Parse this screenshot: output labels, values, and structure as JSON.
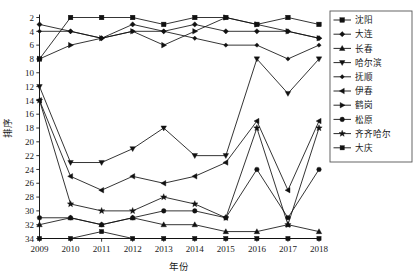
{
  "chart_data": {
    "type": "line",
    "title": "",
    "xlabel": "年份",
    "ylabel": "排序",
    "x": [
      2009,
      2010,
      2011,
      2012,
      2013,
      2014,
      2015,
      2016,
      2017,
      2018
    ],
    "xtick_labels": [
      "2009",
      "2010",
      "2011",
      "2012",
      "2013",
      "2014",
      "2015",
      "2016",
      "2017",
      "2018"
    ],
    "ytick_labels": [
      "2",
      "4",
      "6",
      "8",
      "10",
      "12",
      "14",
      "16",
      "18",
      "20",
      "22",
      "24",
      "26",
      "28",
      "30",
      "32",
      "34"
    ],
    "ytick_values": [
      2,
      4,
      6,
      8,
      10,
      12,
      14,
      16,
      18,
      20,
      22,
      24,
      26,
      28,
      30,
      32,
      34
    ],
    "ylim": [
      2,
      34
    ],
    "y_inverted": true,
    "grid": false,
    "legend_position": "right-outside",
    "series": [
      {
        "name": "沈阳",
        "marker": "square",
        "values": [
          8,
          2,
          2,
          2,
          3,
          2,
          2,
          3,
          2,
          3
        ]
      },
      {
        "name": "大连",
        "marker": "diamond",
        "values": [
          3,
          4,
          5,
          3,
          4,
          3,
          4,
          4,
          4,
          5
        ]
      },
      {
        "name": "长春",
        "marker": "triangle-up",
        "values": [
          32,
          31,
          32,
          31,
          32,
          32,
          33,
          33,
          32,
          33
        ]
      },
      {
        "name": "哈尔滨",
        "marker": "triangle-down",
        "values": [
          12,
          23,
          23,
          21,
          18,
          22,
          22,
          8,
          13,
          8
        ]
      },
      {
        "name": "抚顺",
        "marker": "diamond-small",
        "values": [
          4,
          4,
          5,
          4,
          4,
          5,
          6,
          6,
          8,
          6
        ]
      },
      {
        "name": "伊春",
        "marker": "triangle-left",
        "values": [
          14,
          25,
          27,
          25,
          26,
          25,
          23,
          17,
          27,
          17
        ]
      },
      {
        "name": "鹤岗",
        "marker": "triangle-right",
        "values": [
          8,
          6,
          5,
          4,
          6,
          4,
          2,
          3,
          4,
          5
        ]
      },
      {
        "name": "松原",
        "marker": "circle",
        "values": [
          31,
          31,
          32,
          31,
          30,
          30,
          31,
          24,
          31,
          24
        ]
      },
      {
        "name": "齐齐哈尔",
        "marker": "star",
        "values": [
          14,
          29,
          30,
          30,
          28,
          29,
          31,
          18,
          32,
          18
        ]
      },
      {
        "name": "大庆",
        "marker": "square-small",
        "values": [
          34,
          34,
          33,
          34,
          34,
          34,
          34,
          34,
          34,
          34
        ]
      }
    ]
  },
  "axes": {
    "x_label": "年份",
    "y_label": "排序"
  },
  "legend": {
    "items": [
      {
        "label": "沈阳"
      },
      {
        "label": "大连"
      },
      {
        "label": "长春"
      },
      {
        "label": "哈尔滨"
      },
      {
        "label": "抚顺"
      },
      {
        "label": "伊春"
      },
      {
        "label": "鹤岗"
      },
      {
        "label": "松原"
      },
      {
        "label": "齐齐哈尔"
      },
      {
        "label": "大庆"
      }
    ]
  },
  "colors": {
    "ink": "#111111",
    "axis": "#1a1a1a",
    "legend_border": "#555555",
    "background": "#ffffff"
  }
}
